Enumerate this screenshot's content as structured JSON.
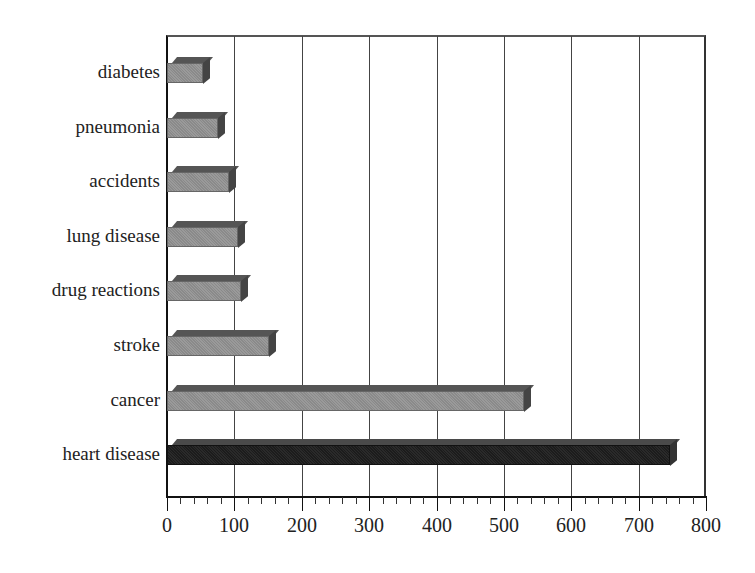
{
  "chart_data": {
    "type": "bar",
    "orientation": "horizontal",
    "title": "",
    "xlabel": "",
    "ylabel": "",
    "categories": [
      "diabetes",
      "pneumonia",
      "accidents",
      "lung disease",
      "drug reactions",
      "stroke",
      "cancer",
      "heart disease"
    ],
    "values": [
      53,
      76,
      92,
      105,
      110,
      152,
      530,
      747
    ],
    "xlim": [
      0,
      800
    ],
    "x_ticks": [
      0,
      100,
      200,
      300,
      400,
      500,
      600,
      700,
      800
    ],
    "grid": "vertical major gridlines",
    "legend": "none",
    "style": "3D shaded bars; heart disease highlighted dark",
    "colors": {
      "default_bar": "#919191",
      "highlight_bar": "#222222"
    }
  },
  "axis": {
    "x_tick_labels": [
      "0",
      "100",
      "200",
      "300",
      "400",
      "500",
      "600",
      "700",
      "800"
    ]
  }
}
